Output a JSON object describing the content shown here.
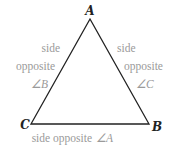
{
  "diagram": {
    "type": "triangle",
    "colors": {
      "edge": "#222222",
      "vertex_label": "#222222",
      "side_label": "#9a9a9a"
    },
    "vertices": {
      "A": {
        "label": "A"
      },
      "B": {
        "label": "B"
      },
      "C": {
        "label": "C"
      }
    },
    "side_labels": {
      "left": {
        "line1": "side",
        "line2": "opposite",
        "angle": "∠B"
      },
      "right": {
        "line1": "side",
        "line2": "opposite",
        "angle": "∠C"
      },
      "bottom": {
        "text": "side opposite",
        "angle": "∠A"
      }
    }
  }
}
